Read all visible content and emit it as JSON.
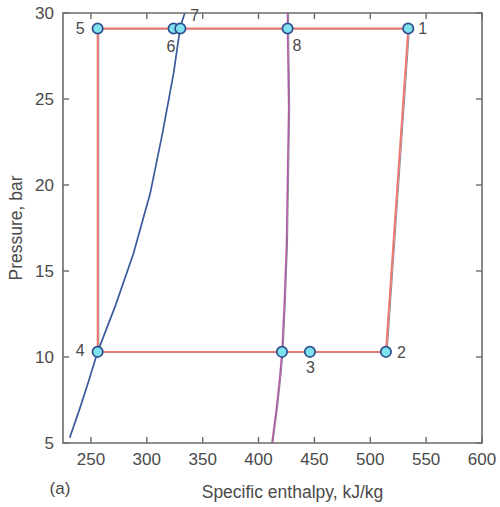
{
  "figure": {
    "panel_label": "(a)",
    "xlabel": "Specific enthalpy, kJ/kg",
    "ylabel": "Pressure, bar"
  },
  "chart_data": {
    "type": "line",
    "title": "",
    "subtitle": "",
    "panel": "(a)",
    "xlabel": "Specific enthalpy, kJ/kg",
    "ylabel": "Pressure, bar",
    "xlim": [
      225,
      600
    ],
    "ylim": [
      5,
      30
    ],
    "xticks": [
      250,
      300,
      350,
      400,
      450,
      500,
      550,
      600
    ],
    "xtick_labels": [
      "250",
      "300",
      "350",
      "400",
      "450",
      "500",
      "550",
      "600"
    ],
    "yticks": [
      5,
      10,
      15,
      20,
      25,
      30
    ],
    "ytick_labels": [
      "5",
      "10",
      "15",
      "20",
      "25",
      "30"
    ],
    "grid": false,
    "legend": "none",
    "xscale": "linear",
    "yscale": "linear",
    "series": [
      {
        "name": "saturated liquid line",
        "color": "#3a5a9c",
        "points": [
          {
            "h": 231,
            "P": 5.3
          },
          {
            "h": 240,
            "P": 7.0
          },
          {
            "h": 248,
            "P": 8.6
          },
          {
            "h": 256,
            "P": 10.3
          },
          {
            "h": 272,
            "P": 13.0
          },
          {
            "h": 288,
            "P": 16.0
          },
          {
            "h": 303,
            "P": 19.5
          },
          {
            "h": 314,
            "P": 23.0
          },
          {
            "h": 324,
            "P": 26.5
          },
          {
            "h": 330,
            "P": 29.2
          },
          {
            "h": 334,
            "P": 30.0
          }
        ]
      },
      {
        "name": "saturated vapor line",
        "color": "#b15ba8",
        "points": [
          {
            "h": 412,
            "P": 5.0
          },
          {
            "h": 416,
            "P": 7.0
          },
          {
            "h": 419,
            "P": 8.8
          },
          {
            "h": 421,
            "P": 10.3
          },
          {
            "h": 423,
            "P": 13.0
          },
          {
            "h": 425,
            "P": 16.5
          },
          {
            "h": 426,
            "P": 20.5
          },
          {
            "h": 427,
            "P": 24.5
          },
          {
            "h": 426,
            "P": 29.1
          },
          {
            "h": 426,
            "P": 30.0
          }
        ]
      },
      {
        "name": "cycle path",
        "color": "#f2756e",
        "points": [
          {
            "h": 534,
            "P": 29.1
          },
          {
            "h": 514,
            "P": 10.3
          },
          {
            "h": 446,
            "P": 10.3
          },
          {
            "h": 421,
            "P": 10.3
          },
          {
            "h": 256,
            "P": 10.3
          },
          {
            "h": 256,
            "P": 29.1
          },
          {
            "h": 324,
            "P": 29.1
          },
          {
            "h": 330,
            "P": 29.1
          },
          {
            "h": 426,
            "P": 29.1
          },
          {
            "h": 534,
            "P": 29.1
          }
        ]
      }
    ],
    "state_points": [
      {
        "id": "1",
        "label": "1",
        "h": 534,
        "P": 29.1,
        "label_dx": 10,
        "label_dy": 6
      },
      {
        "id": "2",
        "label": "2",
        "h": 514,
        "P": 10.3,
        "label_dx": 11,
        "label_dy": 6
      },
      {
        "id": "3",
        "label": "3",
        "h": 446,
        "P": 10.3,
        "label_dx": -4,
        "label_dy": 21
      },
      {
        "id": "3s",
        "label": "",
        "h": 421,
        "P": 10.3,
        "label_dx": 0,
        "label_dy": 0
      },
      {
        "id": "4",
        "label": "4",
        "h": 256,
        "P": 10.3,
        "label_dx": -22,
        "label_dy": 4
      },
      {
        "id": "5",
        "label": "5",
        "h": 256,
        "P": 29.1,
        "label_dx": -22,
        "label_dy": 6
      },
      {
        "id": "6",
        "label": "6",
        "h": 324,
        "P": 29.1,
        "label_dx": -7,
        "label_dy": 24
      },
      {
        "id": "7",
        "label": "7",
        "h": 330,
        "P": 29.1,
        "label_dx": 10,
        "label_dy": -7
      },
      {
        "id": "8",
        "label": "8",
        "h": 426,
        "P": 29.1,
        "label_dx": 5,
        "label_dy": 23
      }
    ],
    "colors": {
      "saturated_liquid": "#3a5a9c",
      "saturated_vapor": "#b15ba8",
      "cycle": "#f2756e",
      "marker_fill": "#7fe3ef",
      "marker_edge": "#2f4f8f",
      "axis": "#6b6b6b"
    }
  }
}
